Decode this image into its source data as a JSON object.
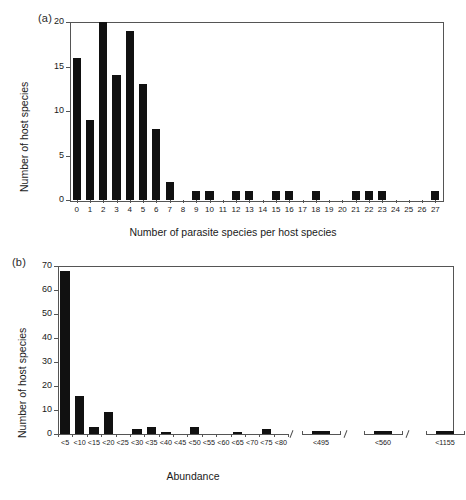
{
  "figure": {
    "panel_a_label": "(a)",
    "panel_b_label": "(b)"
  },
  "chart_data": [
    {
      "panel": "(a)",
      "type": "bar",
      "title": "",
      "xlabel": "Number of parasite species per host species",
      "ylabel": "Number of host species",
      "ylim": [
        0,
        20
      ],
      "yticks": [
        0,
        5,
        10,
        15,
        20
      ],
      "ytick_labels": [
        "0",
        "5",
        "10",
        "15",
        "20"
      ],
      "grid": false,
      "legend": "none",
      "bar_color": "#111111",
      "categories": [
        "0",
        "1",
        "2",
        "3",
        "4",
        "5",
        "6",
        "7",
        "8",
        "9",
        "10",
        "11",
        "12",
        "13",
        "14",
        "15",
        "16",
        "17",
        "18",
        "19",
        "20",
        "21",
        "22",
        "23",
        "24",
        "25",
        "26",
        "27"
      ],
      "values": [
        16,
        9,
        20,
        14,
        19,
        13,
        8,
        2,
        0,
        1,
        1,
        0,
        1,
        1,
        0,
        1,
        1,
        0,
        1,
        0,
        0,
        1,
        1,
        1,
        0,
        0,
        0,
        1
      ]
    },
    {
      "panel": "(b)",
      "type": "bar",
      "title": "",
      "xlabel": "Abundance",
      "ylabel": "Number of host species",
      "ylim": [
        0,
        70
      ],
      "yticks": [
        0,
        10,
        20,
        30,
        40,
        50,
        60,
        70
      ],
      "ytick_labels": [
        "0",
        "10",
        "20",
        "30",
        "40",
        "50",
        "60",
        "70"
      ],
      "grid": false,
      "legend": "none",
      "bar_color": "#111111",
      "axis_break": true,
      "categories": [
        "<5",
        "<10",
        "<15",
        "<20",
        "<25",
        "<30",
        "<35",
        "<40",
        "<45",
        "<50",
        "<55",
        "<60",
        "<65",
        "<70",
        "<75",
        "<80"
      ],
      "values": [
        68,
        16,
        3,
        9,
        0,
        2,
        3,
        1,
        0,
        3,
        0,
        0,
        1,
        0,
        2,
        0
      ],
      "break_categories": [
        "<495",
        "<560",
        "<1155",
        "<3005"
      ],
      "break_values": [
        1,
        1,
        1,
        1
      ]
    }
  ]
}
